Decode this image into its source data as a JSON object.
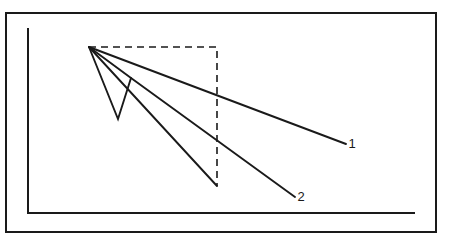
{
  "figure": {
    "title": "",
    "background_color": "#ffffff",
    "ink_color": "#1a1a1a",
    "frame": {
      "name": "outer-border",
      "x": 6,
      "y": 13,
      "width": 430,
      "height": 219,
      "stroke_width": 2
    },
    "axes": {
      "name": "axis-lines",
      "y_axis": {
        "x": 28,
        "y_top": 28,
        "y_bottom": 213
      },
      "x_axis": {
        "y": 213,
        "x_left": 28,
        "x_right": 415
      },
      "stroke_width": 2
    }
  },
  "chart_data": {
    "type": "line",
    "title": "",
    "xlabel": "",
    "ylabel": "",
    "grid": false,
    "legend": "inline-end-labels",
    "xlim": [
      28,
      415
    ],
    "ylim": [
      213,
      28
    ],
    "note": "Schematic decay curves radiating from a common origin point; axis ticks unlabeled.",
    "origin_point": {
      "x": 89,
      "y": 47
    },
    "series": [
      {
        "name": "1",
        "label": "1",
        "style": "solid",
        "label_position": {
          "x": 352,
          "y": 148
        },
        "points": [
          {
            "x": 89,
            "y": 47
          },
          {
            "x": 346,
            "y": 144
          }
        ]
      },
      {
        "name": "2",
        "label": "2",
        "style": "solid",
        "label_position": {
          "x": 301,
          "y": 201
        },
        "points": [
          {
            "x": 89,
            "y": 47
          },
          {
            "x": 131,
            "y": 78
          },
          {
            "x": 295,
            "y": 197
          }
        ]
      },
      {
        "name": "3",
        "label": "",
        "style": "solid",
        "label_position": null,
        "points": [
          {
            "x": 89,
            "y": 47
          },
          {
            "x": 217,
            "y": 186
          }
        ]
      },
      {
        "name": "4",
        "label": "",
        "style": "solid",
        "label_position": null,
        "points": [
          {
            "x": 89,
            "y": 47
          },
          {
            "x": 118,
            "y": 119
          },
          {
            "x": 131,
            "y": 78
          }
        ]
      }
    ],
    "annotations": [
      {
        "name": "reference-rectangle",
        "style": "dashed",
        "points": [
          {
            "x": 89,
            "y": 47
          },
          {
            "x": 217,
            "y": 47
          },
          {
            "x": 217,
            "y": 186
          }
        ],
        "dash_pattern": "7 5"
      }
    ]
  }
}
